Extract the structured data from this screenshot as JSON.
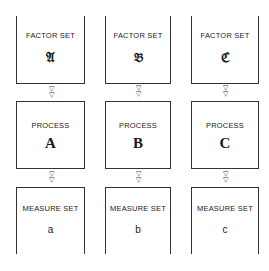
{
  "columns": [
    {
      "factor_set": {
        "label": "FACTOR SET",
        "symbol": "𝔄"
      },
      "process": {
        "label": "PROCESS",
        "name": "A"
      },
      "measure_set": {
        "label": "MEASURE SET",
        "name": "a"
      }
    },
    {
      "factor_set": {
        "label": "FACTOR SET",
        "symbol": "𝔅"
      },
      "process": {
        "label": "PROCESS",
        "name": "B"
      },
      "measure_set": {
        "label": "MEASURE SET",
        "name": "b"
      }
    },
    {
      "factor_set": {
        "label": "FACTOR SET",
        "symbol": "ℭ"
      },
      "process": {
        "label": "PROCESS",
        "name": "C"
      },
      "measure_set": {
        "label": "MEASURE SET",
        "name": "c"
      }
    }
  ],
  "connector": {
    "arrow_glyph": "▽"
  }
}
